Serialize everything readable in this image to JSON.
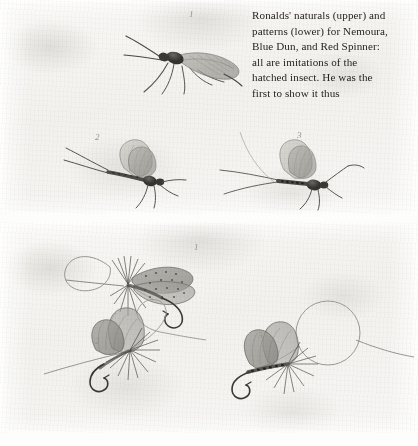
{
  "page": {
    "width": 418,
    "height": 446,
    "background_color": "#ffffff",
    "paper_color": "#f6f5f3",
    "ink_color": "#262422"
  },
  "caption": {
    "text": "Ronalds' naturals (upper) and patterns (lower) for Nemoura, Blue Dun, and Red Spinner: all are imitations of the hatched insect. He was the first to show it thus",
    "lines": [
      "Ronalds' naturals (upper) and",
      "patterns (lower) for Nemoura,",
      "Blue Dun, and Red Spinner:",
      "all are imitations of the",
      "hatched insect. He was the",
      "first to show it thus"
    ]
  },
  "plates": [
    {
      "id": "upper-plate",
      "name": "naturals",
      "title": "Ronalds' naturals (upper)",
      "figures": [
        {
          "number": "1",
          "label": "Nemoura",
          "kind": "stonefly-natural",
          "num_x": 189,
          "num_y": 13
        },
        {
          "number": "2",
          "label": "Blue Dun",
          "kind": "mayfly-natural",
          "num_x": 95,
          "num_y": 136
        },
        {
          "number": "3",
          "label": "Red Spinner",
          "kind": "mayfly-natural",
          "num_x": 297,
          "num_y": 134
        }
      ]
    },
    {
      "id": "lower-plate",
      "name": "patterns",
      "title": "Ronalds' patterns (lower)",
      "figures": [
        {
          "number": "1",
          "label": "Nemoura pattern",
          "kind": "artificial-fly",
          "num_x": 194,
          "num_y": 246
        },
        {
          "number": "2",
          "label": "Blue Dun pattern",
          "kind": "artificial-fly",
          "num_x": 95,
          "num_y": 340
        },
        {
          "number": "3",
          "label": "Red Spinner pattern",
          "kind": "artificial-fly",
          "num_x": 258,
          "num_y": 338
        }
      ]
    }
  ]
}
